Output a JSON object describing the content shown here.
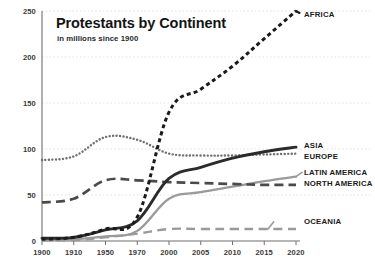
{
  "chart_data": {
    "type": "line",
    "title": "Protestants by Continent",
    "subtitle": "in millions since 1900",
    "xlabel": "",
    "ylabel": "",
    "ylim": [
      0,
      250
    ],
    "yticks": [
      0,
      50,
      100,
      150,
      200,
      250
    ],
    "grid": "horizontal-dotted",
    "legend_position": "right-inline-end-of-line",
    "categories": [
      "1900",
      "1910",
      "1950",
      "1970",
      "2000",
      "2005",
      "2010",
      "2015",
      "2020"
    ],
    "series": [
      {
        "name": "AFRICA",
        "label": "AFRICA",
        "style": "dashed-heavy",
        "color": "#1a1a1a",
        "values": [
          2,
          4,
          13,
          26,
          140,
          165,
          190,
          220,
          250
        ]
      },
      {
        "name": "ASIA",
        "label": "ASIA",
        "style": "solid-heavy",
        "color": "#2b2b2b",
        "values": [
          3,
          4,
          12,
          22,
          68,
          80,
          90,
          97,
          102
        ]
      },
      {
        "name": "EUROPE",
        "label": "EUROPE",
        "style": "dotted",
        "color": "#707070",
        "values": [
          88,
          92,
          113,
          110,
          95,
          93,
          93,
          94,
          95
        ]
      },
      {
        "name": "LATIN AMERICA",
        "label": "LATIN AMERICA",
        "style": "solid-light",
        "color": "#9a9a9a",
        "values": [
          1,
          2,
          5,
          11,
          46,
          53,
          59,
          65,
          70
        ]
      },
      {
        "name": "NORTH AMERICA",
        "label": "NORTH AMERICA",
        "style": "dashed-long",
        "color": "#4a4a4a",
        "values": [
          42,
          46,
          66,
          66,
          64,
          63,
          62,
          61,
          61
        ]
      },
      {
        "name": "OCEANIA",
        "label": "OCEANIA",
        "style": "dashed-long-light",
        "color": "#9a9a9a",
        "values": [
          1,
          1,
          4,
          8,
          13,
          13,
          13,
          13,
          13
        ]
      }
    ]
  },
  "axes": {
    "y_tick_labels": [
      "250",
      "200",
      "150",
      "100",
      "50",
      "0"
    ],
    "x_tick_labels": [
      "1900",
      "1910",
      "1950",
      "1970",
      "2000",
      "2005",
      "2010",
      "2015",
      "2020"
    ]
  },
  "colors": {
    "background": "#ffffff",
    "axis": "#6f6f6f",
    "grid": "#d6d6d6",
    "africa": "#1a1a1a",
    "asia": "#2b2b2b",
    "europe": "#707070",
    "latin_america": "#9a9a9a",
    "north_america": "#4a4a4a",
    "oceania": "#9a9a9a"
  }
}
